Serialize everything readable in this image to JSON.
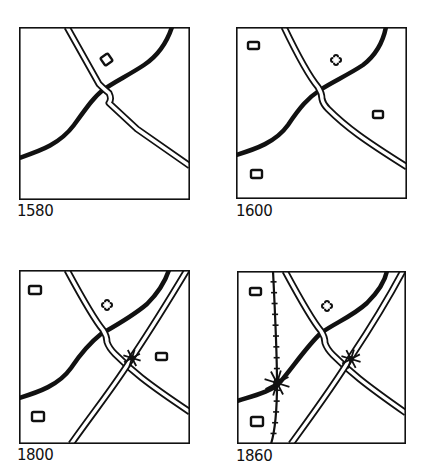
{
  "colors": {
    "ink": "#111111",
    "paper": "#ffffff"
  },
  "panels": [
    {
      "id": "p1580",
      "label": "1580",
      "frame": {
        "x": 19,
        "y": 27,
        "w": 171,
        "h": 173
      },
      "label_pos": {
        "x": 17,
        "y": 204
      },
      "river": "M0,131 C20,124 40,118 55,98 C68,80 75,70 84,63 C95,55 110,48 125,38 C140,28 148,15 153,0",
      "roads": [
        "M48,0 L80,57 Q86,63 90,66 Q93,72 90,76 L118,102 L171,139"
      ],
      "bridges": [],
      "railway": null,
      "buildings": [
        {
          "x": 83,
          "y": 28,
          "w": 9,
          "h": 9,
          "rot": -35
        }
      ],
      "church": null
    },
    {
      "id": "p1600",
      "label": "1600",
      "frame": {
        "x": 236,
        "y": 27,
        "w": 171,
        "h": 172
      },
      "label_pos": {
        "x": 236,
        "y": 204
      },
      "river": "M0,128 C20,122 40,115 52,98 C64,80 72,71 84,63 C96,55 112,48 127,38 C140,28 147,15 150,0",
      "roads": [
        "M48,0 C60,25 72,48 82,60 Q86,66 86,72 Q87,77 92,82 C110,100 128,113 171,140"
      ],
      "bridges": [],
      "railway": null,
      "buildings": [
        {
          "x": 12,
          "y": 15,
          "w": 11,
          "h": 7,
          "rot": 0
        },
        {
          "x": 137,
          "y": 84,
          "w": 10,
          "h": 7,
          "rot": 0
        },
        {
          "x": 15,
          "y": 143,
          "w": 11,
          "h": 8,
          "rot": 0
        }
      ],
      "church": {
        "x": 100,
        "y": 33,
        "size": 11
      }
    },
    {
      "id": "p1800",
      "label": "1800",
      "frame": {
        "x": 19,
        "y": 270,
        "w": 171,
        "h": 174
      },
      "label_pos": {
        "x": 17,
        "y": 448
      },
      "river": "M0,128 C20,122 40,115 52,98 C64,80 72,72 82,64 C96,56 114,46 128,34 C140,22 146,12 150,0",
      "roads": [
        "M48,0 C62,26 74,48 84,60 Q88,66 88,72 Q90,78 96,84 C112,100 126,112 171,142",
        "M52,174 C76,140 100,110 114,86 C130,62 150,30 168,0"
      ],
      "bridges": [
        {
          "x": 113,
          "y": 88,
          "r": 9
        }
      ],
      "railway": null,
      "buildings": [
        {
          "x": 10,
          "y": 16,
          "w": 12,
          "h": 8,
          "rot": 0
        },
        {
          "x": 137,
          "y": 83,
          "w": 11,
          "h": 7,
          "rot": 0
        },
        {
          "x": 13,
          "y": 142,
          "w": 12,
          "h": 9,
          "rot": 0
        }
      ],
      "church": {
        "x": 88,
        "y": 35,
        "size": 11
      }
    },
    {
      "id": "p1860",
      "label": "1860",
      "frame": {
        "x": 237,
        "y": 271,
        "w": 169,
        "h": 173
      },
      "label_pos": {
        "x": 236,
        "y": 449
      },
      "river": "M0,130 C20,124 36,120 44,110 C56,96 70,75 84,62 C98,52 116,45 130,32 C142,20 148,10 150,0",
      "roads": [
        "M48,0 C62,26 74,48 84,60 Q88,66 88,72 Q90,78 96,84 C112,100 126,112 169,142",
        "M54,173 C78,140 100,110 114,86 C130,62 150,30 166,0"
      ],
      "bridges": [
        {
          "x": 114,
          "y": 88,
          "r": 10
        },
        {
          "x": 40,
          "y": 112,
          "r": 13
        }
      ],
      "railway": {
        "path": "M36,0 C38,40 40,80 40,112 C40,140 38,160 34,173",
        "ticks": 16
      },
      "buildings": [
        {
          "x": 13,
          "y": 17,
          "w": 11,
          "h": 7,
          "rot": 0
        },
        {
          "x": 14,
          "y": 146,
          "w": 12,
          "h": 9,
          "rot": 0
        }
      ],
      "church": {
        "x": 90,
        "y": 35,
        "size": 11
      }
    }
  ]
}
